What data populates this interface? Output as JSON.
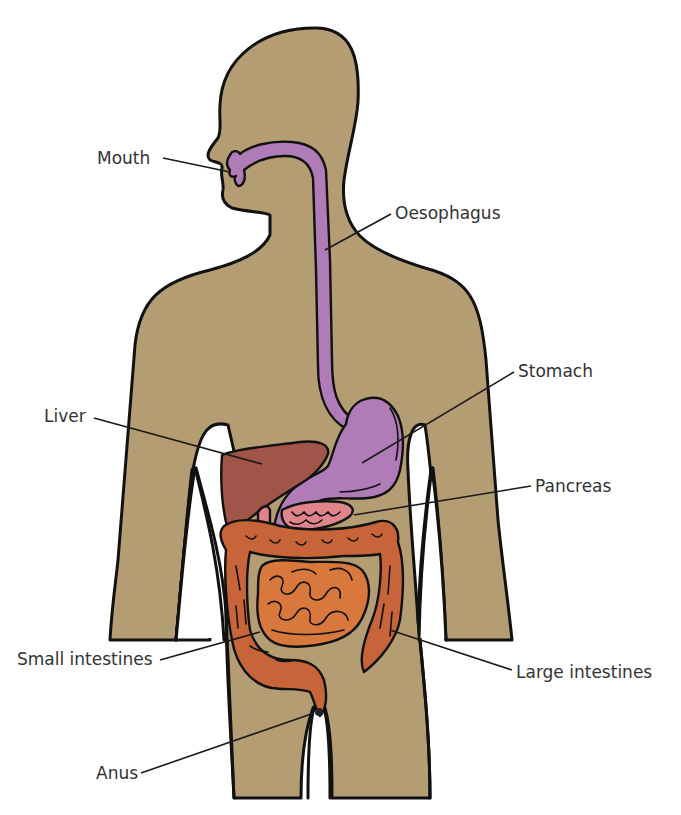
{
  "diagram": {
    "colors": {
      "body": "#b59d73",
      "oesophagus_stomach": "#b07cb8",
      "liver": "#a05548",
      "pancreas": "#e0848c",
      "intestines": "#c8643a",
      "outline": "#111111",
      "label_text": "#333333",
      "background": "#ffffff"
    },
    "labels": [
      {
        "id": "mouth",
        "text": "Mouth",
        "side": "left"
      },
      {
        "id": "oesophagus",
        "text": "Oesophagus",
        "side": "right"
      },
      {
        "id": "stomach",
        "text": "Stomach",
        "side": "right"
      },
      {
        "id": "liver",
        "text": "Liver",
        "side": "left"
      },
      {
        "id": "pancreas",
        "text": "Pancreas",
        "side": "right"
      },
      {
        "id": "small_intestines",
        "text": "Small intestines",
        "side": "left"
      },
      {
        "id": "large_intestines",
        "text": "Large intestines",
        "side": "right"
      },
      {
        "id": "anus",
        "text": "Anus",
        "side": "left"
      }
    ]
  }
}
